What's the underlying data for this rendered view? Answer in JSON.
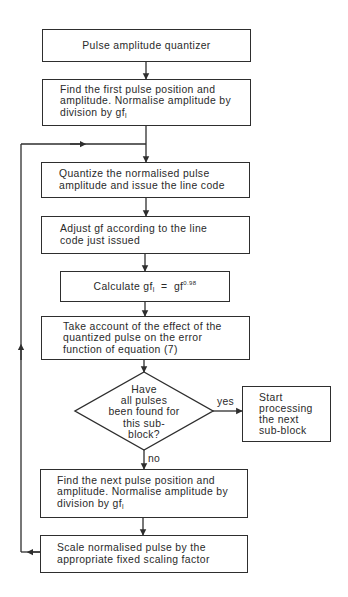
{
  "diagram": {
    "type": "flowchart",
    "nodes": {
      "start": {
        "text": "Pulse amplitude quantizer"
      },
      "find_first": {
        "text": "Find the first pulse position and\namplitude. Normalise amplitude by\ndivision by gf",
        "subscript": "l"
      },
      "quantize": {
        "text": "Quantize the normalised pulse\namplitude and issue the line code"
      },
      "adjust": {
        "text": "Adjust gf according to the line\ncode just issued"
      },
      "calculate": {
        "prefix": "Calculate gf",
        "subscript": "l",
        "middle": "  =  gf",
        "superscript": "0.98"
      },
      "account": {
        "text": "Take account of the effect of the\nquantized pulse on the error\nfunction of equation (7)"
      },
      "decision": {
        "text": "Have\nall pulses\nbeen found for\nthis sub-\nblock?"
      },
      "next_subblock": {
        "text": "Start\nprocessing\nthe next\nsub-block"
      },
      "find_next": {
        "text": "Find the next pulse position and\namplitude. Normalise amplitude by\ndivision by gf",
        "subscript": "l"
      },
      "scale": {
        "text": "Scale normalised pulse by the\nappropriate fixed scaling factor"
      }
    },
    "edge_labels": {
      "yes": "yes",
      "no": "no"
    },
    "edges": [
      {
        "from": "start",
        "to": "find_first"
      },
      {
        "from": "find_first",
        "to": "quantize"
      },
      {
        "from": "quantize",
        "to": "adjust"
      },
      {
        "from": "adjust",
        "to": "calculate"
      },
      {
        "from": "calculate",
        "to": "account"
      },
      {
        "from": "account",
        "to": "decision"
      },
      {
        "from": "decision",
        "to": "next_subblock",
        "label": "yes"
      },
      {
        "from": "decision",
        "to": "find_next",
        "label": "no"
      },
      {
        "from": "find_next",
        "to": "scale"
      },
      {
        "from": "scale",
        "to": "quantize",
        "label": "loop"
      }
    ],
    "colors": {
      "line": "#2e2e2e",
      "text": "#2a2a2a",
      "background": "#ffffff"
    }
  }
}
